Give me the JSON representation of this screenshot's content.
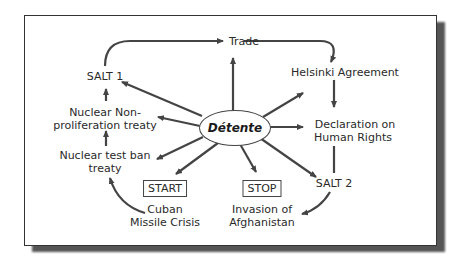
{
  "diagram": {
    "center": "Détente",
    "nodes": {
      "trade": "Trade",
      "helsinki": "Helsinki Agreement",
      "declaration_1": "Declaration on",
      "declaration_2": "Human Rights",
      "salt2": "SALT 2",
      "stop": "STOP",
      "invasion_1": "Invasion of",
      "invasion_2": "Afghanistan",
      "start": "START",
      "cuban_1": "Cuban",
      "cuban_2": "Missile Crisis",
      "test_ban_1": "Nuclear test ban",
      "test_ban_2": "treaty",
      "nonprolif_1": "Nuclear Non-",
      "nonprolif_2": "proliferation treaty",
      "salt1": "SALT 1"
    },
    "colors": {
      "arrow": "#444444",
      "frame_shadow": "#555555"
    }
  }
}
